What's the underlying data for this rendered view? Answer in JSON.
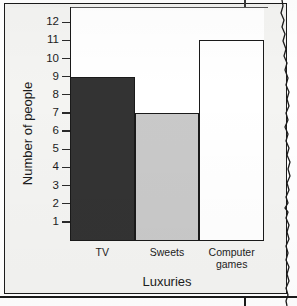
{
  "chart_data": {
    "type": "bar",
    "title": "",
    "xlabel": "Luxuries",
    "ylabel": "Number of people",
    "categories": [
      "TV",
      "Sweets",
      "Computer games"
    ],
    "values": [
      9,
      7,
      11
    ],
    "ylim": [
      0,
      12.5
    ],
    "yticks": [
      1,
      2,
      3,
      4,
      5,
      6,
      7,
      8,
      9,
      10,
      11,
      12
    ],
    "ytick_labels": [
      "1",
      "2",
      "3",
      "4",
      "5",
      "6",
      "7",
      "8",
      "9",
      "10",
      "11",
      "12"
    ],
    "grid": false,
    "legend": null,
    "bar_colors": [
      "#333333",
      "#c9c9c9",
      "#ffffff"
    ],
    "bar_edge_color": "#1a1a1a",
    "axis_color": "#1a1a1a"
  },
  "axes": {
    "y_title": "Number of people",
    "x_title": "Luxuries",
    "ticks": [
      {
        "value": 12,
        "label": "12"
      },
      {
        "value": 11,
        "label": "11"
      },
      {
        "value": 10,
        "label": "10"
      },
      {
        "value": 9,
        "label": "9"
      },
      {
        "value": 8,
        "label": "8"
      },
      {
        "value": 7,
        "label": "7"
      },
      {
        "value": 6,
        "label": "6"
      },
      {
        "value": 5,
        "label": "5"
      },
      {
        "value": 4,
        "label": "4"
      },
      {
        "value": 3,
        "label": "3"
      },
      {
        "value": 2,
        "label": "2"
      },
      {
        "value": 1,
        "label": "1"
      }
    ]
  },
  "bars": [
    {
      "category": "TV",
      "label_lines": [
        "TV"
      ],
      "value": 9,
      "color": "#333333"
    },
    {
      "category": "Sweets",
      "label_lines": [
        "Sweets"
      ],
      "value": 7,
      "color": "#c9c9c9"
    },
    {
      "category": "Computer games",
      "label_lines": [
        "Computer",
        "games"
      ],
      "value": 11,
      "color": "#ffffff"
    }
  ],
  "page": {
    "background_color": "#f2f2f0",
    "frame_color": "#1a1a1a"
  }
}
